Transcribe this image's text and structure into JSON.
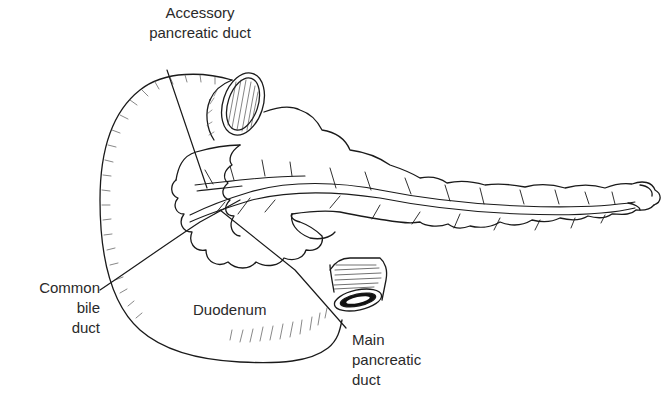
{
  "figure": {
    "stroke_color": "#1a1a1a",
    "background": "#ffffff"
  },
  "labels": {
    "accessory_duct": {
      "line1": "Accessory",
      "line2": "pancreatic duct"
    },
    "common_bile_duct": {
      "line1": "Common",
      "line2": "bile",
      "line3": "duct"
    },
    "duodenum": {
      "text": "Duodenum"
    },
    "main_duct": {
      "line1": "Main",
      "line2": "pancreatic",
      "line3": "duct"
    }
  }
}
